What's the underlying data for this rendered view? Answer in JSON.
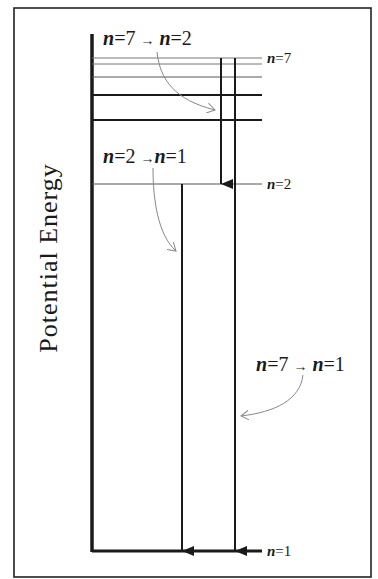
{
  "axis": {
    "label": "Potential Energy"
  },
  "levels": [
    {
      "n": 1,
      "label_n": "n",
      "label_eq": "=1",
      "y": 551
    },
    {
      "n": 2,
      "label_n": "n",
      "label_eq": "=2",
      "y": 184
    },
    {
      "n": 7,
      "label_n": "n",
      "label_eq": "=7",
      "y": 58
    }
  ],
  "extra_levels_y": [
    64,
    77,
    95,
    120
  ],
  "transitions": [
    {
      "id": "t72",
      "from": 7,
      "to": 2,
      "caption_parts": [
        "n",
        "=7 ",
        "→",
        " n",
        "=2"
      ]
    },
    {
      "id": "t21",
      "from": 2,
      "to": 1,
      "caption_parts": [
        "n",
        "=2 ",
        "→",
        "n",
        "=1"
      ]
    },
    {
      "id": "t71",
      "from": 7,
      "to": 1,
      "caption_parts": [
        "n",
        "=7 ",
        "→",
        " n",
        "=1"
      ]
    }
  ],
  "colors": {
    "line": "#1a1a1a",
    "thin_line": "#777777",
    "pointer": "#888888",
    "background": "#ffffff"
  }
}
